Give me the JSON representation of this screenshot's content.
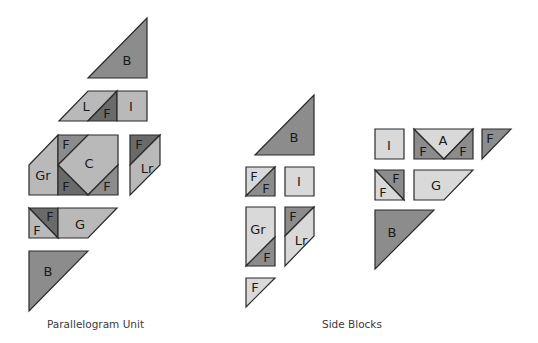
{
  "colors": {
    "dark": "#6a6a6a",
    "medium": "#8c8c8c",
    "light_medium": "#b9b9b9",
    "light": "#d9d9d9",
    "outline": "#2a2a2a"
  },
  "captions": {
    "parallelogram_unit": "Parallelogram Unit",
    "side_blocks": "Side Blocks"
  },
  "parallelogram_unit": {
    "pieces": [
      {
        "id": "pu-b-top",
        "label": "B",
        "fill": "medium",
        "points": "88,78 147,18 147,78",
        "lx": 127,
        "ly": 60
      },
      {
        "id": "pu-l",
        "label": "L",
        "fill": "light_medium",
        "points": "59,121 88,91 117,91 88,121",
        "lx": 86,
        "ly": 106
      },
      {
        "id": "pu-f-lrow",
        "label": "F",
        "fill": "dark",
        "points": "88,121 117,91 117,121",
        "lx": 107,
        "ly": 113
      },
      {
        "id": "pu-i",
        "label": "I",
        "fill": "light_medium",
        "points": "117,91 147,91 147,121 117,121",
        "lx": 131,
        "ly": 106
      },
      {
        "id": "pu-gr",
        "label": "Gr",
        "fill": "light_medium",
        "points": "29,165 58,135 58,195 29,195",
        "lx": 43,
        "ly": 175
      },
      {
        "id": "pu-f-c-tl",
        "label": "F",
        "fill": "medium",
        "points": "58,135 88,135 58,165",
        "lx": 66,
        "ly": 144
      },
      {
        "id": "pu-c",
        "label": "C",
        "fill": "light_medium",
        "points": "88,135 118,135 118,165 88,195 58,165",
        "lx": 89,
        "ly": 163
      },
      {
        "id": "pu-f-c-bl",
        "label": "F",
        "fill": "dark",
        "points": "58,165 88,195 58,195",
        "lx": 66,
        "ly": 186
      },
      {
        "id": "pu-f-c-br",
        "label": "F",
        "fill": "medium",
        "points": "88,195 118,165 118,195",
        "lx": 107,
        "ly": 186
      },
      {
        "id": "pu-f-lr",
        "label": "F",
        "fill": "dark",
        "points": "130,135 160,135 130,165",
        "lx": 139,
        "ly": 144
      },
      {
        "id": "pu-lr",
        "label": "Lr",
        "fill": "light_medium",
        "points": "160,135 160,165 130,195 130,165",
        "lx": 147,
        "ly": 168
      },
      {
        "id": "pu-f-g-dark",
        "label": "F",
        "fill": "dark",
        "points": "29,208 58,208 58,238",
        "lx": 50,
        "ly": 216
      },
      {
        "id": "pu-f-g-light",
        "label": "F",
        "fill": "light_medium",
        "points": "29,208 58,238 29,238",
        "lx": 37,
        "ly": 230
      },
      {
        "id": "pu-g",
        "label": "G",
        "fill": "light_medium",
        "points": "58,208 117,208 88,238 58,238",
        "lx": 80,
        "ly": 224
      },
      {
        "id": "pu-b-bottom",
        "label": "B",
        "fill": "medium",
        "points": "29,251 88,251 29,311",
        "lx": 48,
        "ly": 271
      }
    ]
  },
  "side_blocks": {
    "pieces": [
      {
        "id": "sb-b-top",
        "label": "B",
        "fill": "medium",
        "points": "255,155 314,95 314,155",
        "lx": 294,
        "ly": 137
      },
      {
        "id": "sb-ff-light",
        "label": "F",
        "fill": "light",
        "points": "246,167 275,167 246,196",
        "lx": 254,
        "ly": 176
      },
      {
        "id": "sb-ff-dark",
        "label": "F",
        "fill": "medium",
        "points": "275,167 275,196 246,196",
        "lx": 266,
        "ly": 188
      },
      {
        "id": "sb-i-left",
        "label": "I",
        "fill": "light",
        "points": "285,167 314,167 314,196 285,196",
        "lx": 299,
        "ly": 181
      },
      {
        "id": "sb-gr",
        "label": "Gr",
        "fill": "light",
        "points": "246,207 275,207 275,237 246,266",
        "lx": 258,
        "ly": 229
      },
      {
        "id": "sb-f-gr",
        "label": "F",
        "fill": "medium",
        "points": "275,237 275,266 246,266",
        "lx": 267,
        "ly": 257
      },
      {
        "id": "sb-f-lr",
        "label": "F",
        "fill": "medium",
        "points": "285,207 314,207 285,236",
        "lx": 293,
        "ly": 216
      },
      {
        "id": "sb-lr",
        "label": "Lr",
        "fill": "light",
        "points": "314,207 314,236 285,266 285,236",
        "lx": 301,
        "ly": 240
      },
      {
        "id": "sb-f-single-left",
        "label": "F",
        "fill": "light",
        "points": "246,278 275,278 246,307",
        "lx": 255,
        "ly": 287
      },
      {
        "id": "sb-i-right",
        "label": "I",
        "fill": "light",
        "points": "375,129 404,129 404,159 375,159",
        "lx": 389,
        "ly": 145
      },
      {
        "id": "sb-f-a-left",
        "label": "F",
        "fill": "medium",
        "points": "414,129 444,159 414,159",
        "lx": 423,
        "ly": 151
      },
      {
        "id": "sb-a",
        "label": "A",
        "fill": "light",
        "points": "414,129 473,129 444,159",
        "lx": 443,
        "ly": 140
      },
      {
        "id": "sb-f-a-right",
        "label": "F",
        "fill": "medium",
        "points": "444,159 473,129 473,159",
        "lx": 463,
        "ly": 151
      },
      {
        "id": "sb-f-single-right",
        "label": "F",
        "fill": "medium",
        "points": "482,129 511,129 482,159",
        "lx": 490,
        "ly": 138
      },
      {
        "id": "sb-ff2-dark",
        "label": "F",
        "fill": "medium",
        "points": "375,170 404,170 404,200",
        "lx": 396,
        "ly": 178
      },
      {
        "id": "sb-ff2-light",
        "label": "F",
        "fill": "light",
        "points": "375,170 404,200 375,200",
        "lx": 383,
        "ly": 192
      },
      {
        "id": "sb-g",
        "label": "G",
        "fill": "light",
        "points": "414,170 473,170 444,200 414,200",
        "lx": 436,
        "ly": 185
      },
      {
        "id": "sb-b-bottom",
        "label": "B",
        "fill": "medium",
        "points": "375,210 434,210 375,269",
        "lx": 392,
        "ly": 232
      }
    ]
  }
}
